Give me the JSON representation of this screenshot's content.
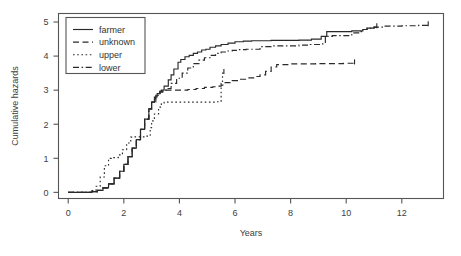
{
  "figure": {
    "background_color": "#ffffff",
    "ink_color": "#2a2a2a",
    "axis_color": "#555555"
  },
  "chart_data": {
    "type": "line",
    "subtype": "step",
    "title": "",
    "xlabel": "Years",
    "ylabel": "Cumulative hazards",
    "xlim": [
      -0.35,
      13.5
    ],
    "ylim": [
      -0.18,
      5.25
    ],
    "xticks": [
      0,
      2,
      4,
      6,
      8,
      10,
      12
    ],
    "xtick_labels": [
      "0",
      "2",
      "4",
      "6",
      "8",
      "10",
      "12"
    ],
    "yticks": [
      0,
      1,
      2,
      3,
      4,
      5
    ],
    "ytick_labels": [
      "0",
      "1",
      "2",
      "3",
      "4",
      "5"
    ],
    "grid": false,
    "legend_position": "top-left",
    "series": [
      {
        "name": "farmer",
        "label": "farmer",
        "dash": "none",
        "dash_array": "",
        "x": [
          0.0,
          0.55,
          0.85,
          1.05,
          1.25,
          1.45,
          1.65,
          1.85,
          2.0,
          2.15,
          2.3,
          2.45,
          2.6,
          2.75,
          2.9,
          3.0,
          3.1,
          3.2,
          3.3,
          3.35,
          3.45,
          3.6,
          3.7,
          3.8,
          3.95,
          4.05,
          4.2,
          4.35,
          4.5,
          4.65,
          4.8,
          4.95,
          5.1,
          5.3,
          5.5,
          5.75,
          6.0,
          6.3,
          6.6,
          6.9,
          7.3,
          7.8,
          8.3,
          8.75,
          9.1,
          9.3,
          9.7,
          10.2,
          10.6,
          10.75,
          11.0,
          11.1
        ],
        "y": [
          0.0,
          0.0,
          0.02,
          0.06,
          0.13,
          0.25,
          0.42,
          0.62,
          0.82,
          1.05,
          1.3,
          1.55,
          1.85,
          2.15,
          2.45,
          2.65,
          2.8,
          2.9,
          2.97,
          3.0,
          3.12,
          3.3,
          3.45,
          3.62,
          3.82,
          3.9,
          3.98,
          4.02,
          4.08,
          4.12,
          4.18,
          4.2,
          4.26,
          4.3,
          4.34,
          4.38,
          4.42,
          4.44,
          4.45,
          4.45,
          4.46,
          4.46,
          4.47,
          4.5,
          4.58,
          4.72,
          4.72,
          4.74,
          4.78,
          4.82,
          4.85,
          4.86
        ]
      },
      {
        "name": "unknown",
        "label": "unknown",
        "dash": "dashed",
        "dash_array": "6,3.5",
        "x": [
          0.0,
          0.55,
          0.85,
          1.05,
          1.25,
          1.45,
          1.65,
          1.85,
          2.0,
          2.15,
          2.3,
          2.45,
          2.6,
          2.75,
          2.9,
          3.0,
          3.15,
          3.3,
          3.4,
          3.55,
          3.75,
          4.0,
          4.3,
          4.6,
          4.9,
          5.2,
          5.4,
          5.5,
          5.6,
          5.9,
          6.2,
          6.5,
          6.7,
          6.9,
          7.1,
          7.3,
          7.5,
          7.9,
          8.4,
          8.9,
          9.4,
          9.9,
          10.3
        ],
        "y": [
          0.0,
          0.0,
          0.02,
          0.06,
          0.13,
          0.25,
          0.42,
          0.62,
          0.82,
          1.05,
          1.3,
          1.55,
          1.85,
          2.15,
          2.45,
          2.65,
          2.85,
          2.95,
          3.0,
          3.0,
          3.0,
          3.0,
          3.02,
          3.05,
          3.08,
          3.1,
          3.12,
          3.15,
          3.22,
          3.28,
          3.32,
          3.36,
          3.4,
          3.45,
          3.55,
          3.68,
          3.75,
          3.77,
          3.77,
          3.78,
          3.78,
          3.79,
          3.8
        ]
      },
      {
        "name": "upper",
        "label": "upper",
        "dash": "dotted",
        "dash_array": "1.6,2.6",
        "x": [
          0.0,
          0.55,
          0.85,
          1.0,
          1.15,
          1.3,
          1.45,
          1.55,
          1.65,
          1.8,
          1.95,
          2.1,
          2.25,
          2.35,
          2.5,
          2.65,
          2.8,
          2.95,
          3.0,
          3.1,
          3.25,
          3.35,
          3.45,
          3.5,
          3.6,
          4.0,
          4.5,
          5.0,
          5.35,
          5.45,
          5.5,
          5.55,
          5.6
        ],
        "y": [
          0.0,
          0.0,
          0.05,
          0.18,
          0.45,
          0.78,
          1.0,
          1.02,
          1.02,
          1.1,
          1.25,
          1.45,
          1.62,
          1.63,
          1.63,
          1.63,
          1.65,
          1.9,
          2.1,
          2.3,
          2.5,
          2.6,
          2.64,
          2.65,
          2.65,
          2.65,
          2.65,
          2.65,
          2.66,
          2.66,
          3.2,
          3.5,
          3.52
        ]
      },
      {
        "name": "lower",
        "label": "lower",
        "dash": "dashdot",
        "dash_array": "6,2.6,1.5,2.6",
        "x": [
          0.0,
          0.55,
          0.85,
          1.05,
          1.25,
          1.45,
          1.65,
          1.85,
          2.0,
          2.15,
          2.3,
          2.45,
          2.6,
          2.75,
          2.9,
          3.0,
          3.15,
          3.3,
          3.4,
          3.55,
          3.7,
          3.9,
          4.1,
          4.3,
          4.5,
          4.7,
          4.9,
          5.1,
          5.3,
          5.5,
          5.7,
          5.9,
          6.1,
          6.4,
          6.7,
          6.9,
          7.3,
          7.8,
          8.3,
          8.7,
          9.1,
          9.25,
          9.5,
          9.8,
          10.2,
          10.5,
          10.6,
          10.75,
          11.0,
          11.4,
          12.0,
          12.6,
          12.95
        ],
        "y": [
          0.0,
          0.0,
          0.02,
          0.06,
          0.13,
          0.25,
          0.42,
          0.62,
          0.82,
          1.05,
          1.3,
          1.55,
          1.85,
          2.15,
          2.45,
          2.65,
          2.85,
          2.95,
          3.0,
          3.05,
          3.2,
          3.35,
          3.5,
          3.65,
          3.78,
          3.88,
          3.95,
          4.02,
          4.08,
          4.12,
          4.15,
          4.17,
          4.19,
          4.2,
          4.2,
          4.28,
          4.3,
          4.3,
          4.32,
          4.34,
          4.36,
          4.58,
          4.6,
          4.6,
          4.68,
          4.72,
          4.78,
          4.82,
          4.85,
          4.88,
          4.89,
          4.9,
          4.92
        ]
      }
    ]
  },
  "legend": {
    "entries": [
      {
        "label": "farmer",
        "dash": "none"
      },
      {
        "label": "unknown",
        "dash": "dashed"
      },
      {
        "label": "upper",
        "dash": "dotted"
      },
      {
        "label": "lower",
        "dash": "dashdot"
      }
    ]
  }
}
